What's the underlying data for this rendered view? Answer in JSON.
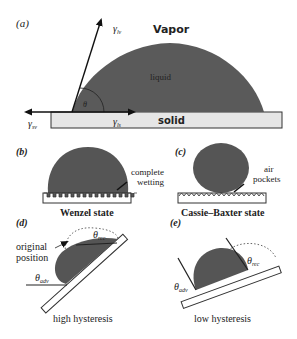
{
  "panels": {
    "a": {
      "label": "(a)",
      "vapor": "Vapor",
      "liquid": "liquid",
      "solid": "solid",
      "theta": "θ",
      "gamma_lv": "γlv",
      "gamma_lv_sym": "γ",
      "gamma_lv_sub": "lv",
      "gamma_sl_sym": "γ",
      "gamma_sl_sub": "ls",
      "gamma_sv_sym": "γ",
      "gamma_sv_sub": "sv"
    },
    "b": {
      "label": "(b)",
      "annotation_line1": "complete",
      "annotation_line2": "wetting",
      "caption": "Wenzel state"
    },
    "c": {
      "label": "(c)",
      "annotation_line1": "air",
      "annotation_line2": "pockets",
      "caption": "Cassie–Baxter state"
    },
    "d": {
      "label": "(d)",
      "annotation_line1": "original",
      "annotation_line2": "position",
      "theta_rec_sym": "θ",
      "theta_rec_sub": "rec",
      "theta_adv_sym": "θ",
      "theta_adv_sub": "adv",
      "caption": "high hysteresis"
    },
    "e": {
      "label": "(e)",
      "theta_rec_sym": "θ",
      "theta_rec_sub": "rec",
      "theta_adv_sym": "θ",
      "theta_adv_sub": "adv",
      "caption": "low hysteresis"
    }
  },
  "colors": {
    "droplet": "#5a5a5a",
    "solid_fill": "#e6e6e6",
    "stroke": "#222222"
  }
}
